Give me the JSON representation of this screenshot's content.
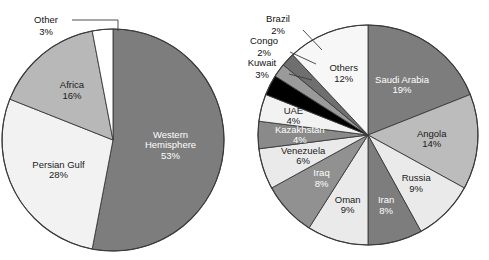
{
  "chart_data": [
    {
      "type": "pie",
      "id": "us-crude-oil-imports-by-region",
      "title": "",
      "legend_position": "none",
      "labels_inside": true,
      "categories": [
        "Western Hemisphere",
        "Persian Gulf",
        "Africa",
        "Other"
      ],
      "values": [
        53,
        28,
        16,
        3
      ],
      "value_suffix": "%",
      "start_angle_deg": 0,
      "direction": "clockwise",
      "slices": [
        {
          "label": "Western Hemisphere",
          "value": 53,
          "value_text": "53%",
          "color": "#7d7d7d",
          "text_color": "#ffffff",
          "label_placement": "inside",
          "label_lines": [
            "Western",
            "Hemisphere",
            "53%"
          ]
        },
        {
          "label": "Persian Gulf",
          "value": 28,
          "value_text": "28%",
          "color": "#f2f2f2",
          "text_color": "#111111",
          "label_placement": "inside",
          "label_lines": [
            "Persian Gulf",
            "28%"
          ]
        },
        {
          "label": "Africa",
          "value": 16,
          "value_text": "16%",
          "color": "#b8b8b8",
          "text_color": "#111111",
          "label_placement": "inside",
          "label_lines": [
            "Africa",
            "16%"
          ]
        },
        {
          "label": "Other",
          "value": 3,
          "value_text": "3%",
          "color": "#ffffff",
          "text_color": "#111111",
          "label_placement": "callout",
          "label_lines": [
            "Other",
            "3%"
          ]
        }
      ]
    },
    {
      "type": "pie",
      "id": "us-crude-oil-imports-by-country",
      "title": "",
      "legend_position": "none",
      "labels_inside": true,
      "categories": [
        "Saudi Arabia",
        "Angola",
        "Russia",
        "Iran",
        "Oman",
        "Iraq",
        "Venezuela",
        "Kazakhstan",
        "UAE",
        "Kuwait",
        "Congo",
        "Brazil",
        "Others"
      ],
      "values": [
        19,
        14,
        9,
        8,
        9,
        8,
        6,
        4,
        4,
        3,
        2,
        2,
        12
      ],
      "value_suffix": "%",
      "start_angle_deg": 0,
      "direction": "clockwise",
      "slices": [
        {
          "label": "Saudi Arabia",
          "value": 19,
          "value_text": "19%",
          "color": "#7d7d7d",
          "text_color": "#ffffff",
          "label_placement": "inside",
          "label_lines": [
            "Saudi Arabia",
            "19%"
          ]
        },
        {
          "label": "Angola",
          "value": 14,
          "value_text": "14%",
          "color": "#bcbcbc",
          "text_color": "#111111",
          "label_placement": "inside",
          "label_lines": [
            "Angola",
            "14%"
          ]
        },
        {
          "label": "Russia",
          "value": 9,
          "value_text": "9%",
          "color": "#eaeaea",
          "text_color": "#111111",
          "label_placement": "inside",
          "label_lines": [
            "Russia",
            "9%"
          ]
        },
        {
          "label": "Iran",
          "value": 8,
          "value_text": "8%",
          "color": "#7d7d7d",
          "text_color": "#ffffff",
          "label_placement": "inside",
          "label_lines": [
            "Iran",
            "8%"
          ]
        },
        {
          "label": "Oman",
          "value": 9,
          "value_text": "9%",
          "color": "#eaeaea",
          "text_color": "#111111",
          "label_placement": "inside",
          "label_lines": [
            "Oman",
            "9%"
          ]
        },
        {
          "label": "Iraq",
          "value": 8,
          "value_text": "8%",
          "color": "#919191",
          "text_color": "#ffffff",
          "label_placement": "inside",
          "label_lines": [
            "Iraq",
            "8%"
          ]
        },
        {
          "label": "Venezuela",
          "value": 6,
          "value_text": "6%",
          "color": "#eaeaea",
          "text_color": "#111111",
          "label_placement": "inside",
          "label_lines": [
            "Venezuela",
            "6%"
          ]
        },
        {
          "label": "Kazakhstan",
          "value": 4,
          "value_text": "4%",
          "color": "#8a8a8a",
          "text_color": "#ffffff",
          "label_placement": "inside",
          "label_lines": [
            "Kazakhstan",
            "4%"
          ]
        },
        {
          "label": "UAE",
          "value": 4,
          "value_text": "4%",
          "color": "#f2f2f2",
          "text_color": "#111111",
          "label_placement": "inside",
          "label_lines": [
            "UAE",
            "4%"
          ]
        },
        {
          "label": "Kuwait",
          "value": 3,
          "value_text": "3%",
          "color": "#000000",
          "text_color": "#111111",
          "label_placement": "callout",
          "label_lines": [
            "Kuwait",
            "3%"
          ]
        },
        {
          "label": "Congo",
          "value": 2,
          "value_text": "2%",
          "color": "#9a9a9a",
          "text_color": "#111111",
          "label_placement": "callout",
          "label_lines": [
            "Congo",
            "2%"
          ]
        },
        {
          "label": "Brazil",
          "value": 2,
          "value_text": "2%",
          "color": "#6f6f6f",
          "text_color": "#111111",
          "label_placement": "callout",
          "label_lines": [
            "Brazil",
            "2%"
          ]
        },
        {
          "label": "Others",
          "value": 12,
          "value_text": "12%",
          "color": "#f7f7f7",
          "text_color": "#111111",
          "label_placement": "inside",
          "label_lines": [
            "Others",
            "12%"
          ]
        }
      ]
    }
  ],
  "figure": {
    "background": "#ffffff",
    "outline_color": "#3a3a3a"
  }
}
